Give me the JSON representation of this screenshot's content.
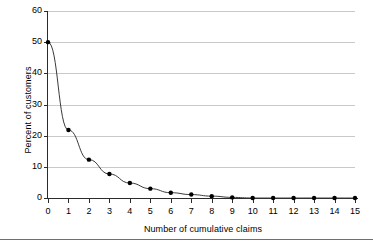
{
  "chart_data": {
    "type": "line",
    "title": "",
    "xlabel": "Number of cumulative claims",
    "ylabel": "Percent of customers",
    "x": [
      0,
      1,
      2,
      3,
      4,
      5,
      6,
      7,
      8,
      9,
      10,
      11,
      12,
      13,
      14,
      15
    ],
    "values": [
      50.0,
      21.8,
      12.3,
      7.7,
      4.8,
      3.0,
      1.7,
      1.1,
      0.6,
      0.2,
      0.0,
      0.0,
      0.0,
      0.0,
      0.0,
      0.0
    ],
    "series": [
      {
        "name": "Percent of customers",
        "values": [
          50.0,
          21.8,
          12.3,
          7.7,
          4.8,
          3.0,
          1.7,
          1.1,
          0.6,
          0.2,
          0.0,
          0.0,
          0.0,
          0.0,
          0.0,
          0.0
        ]
      }
    ],
    "xlim": [
      0,
      15
    ],
    "ylim": [
      0,
      60
    ],
    "xticks": [
      0,
      1,
      2,
      3,
      4,
      5,
      6,
      7,
      8,
      9,
      10,
      11,
      12,
      13,
      14,
      15
    ],
    "xtick_labels": [
      "0",
      "1",
      "2",
      "3",
      "4",
      "5",
      "6",
      "7",
      "8",
      "9",
      "10",
      "11",
      "12",
      "13",
      "14",
      "15"
    ],
    "yticks": [
      0,
      10,
      20,
      30,
      40,
      50,
      60
    ],
    "ytick_labels": [
      "0",
      "10",
      "20",
      "30",
      "40",
      "50",
      "60"
    ],
    "grid": "horizontal",
    "legend": "none",
    "marker": "filled-circle",
    "line_color": "#3a3a3a",
    "marker_color": "#000000",
    "grid_color": "#c9c9c9",
    "axis_color": "#2b2b2b",
    "background": "#ffffff"
  }
}
